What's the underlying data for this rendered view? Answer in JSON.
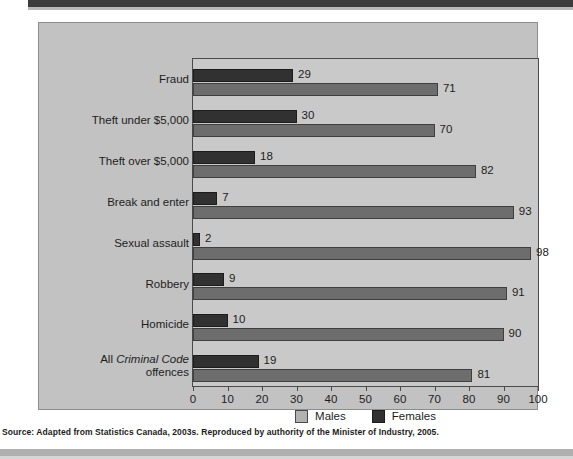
{
  "figure": {
    "source_note": "Source: Adapted from Statistics Canada, 2003s. Reproduced by authority of the Minister of Industry, 2005."
  },
  "legend": {
    "items": [
      {
        "label": "Males",
        "color": "#b2b2b2"
      },
      {
        "label": "Females",
        "color": "#313131"
      }
    ]
  },
  "chart_data": {
    "type": "bar",
    "orientation": "horizontal",
    "title": "",
    "subtitle": "",
    "xlabel": "",
    "ylabel": "",
    "xlim": [
      0,
      100
    ],
    "xticks": [
      "0",
      "10",
      "20",
      "30",
      "40",
      "50",
      "60",
      "70",
      "80",
      "90",
      "100"
    ],
    "grid": false,
    "legend_position": "bottom-center",
    "categories": [
      "Fraud",
      "Theft under $5,000",
      "Theft over $5,000",
      "Break and enter",
      "Sexual assault",
      "Robbery",
      "Homicide",
      "All Criminal Code offences"
    ],
    "category_labels_html": [
      "Fraud",
      "Theft under $5,000",
      "Theft over $5,000",
      "Break and enter",
      "Sexual assault",
      "Robbery",
      "Homicide",
      "All <i>Criminal Code</i>\noffences"
    ],
    "series": [
      {
        "name": "Females",
        "color": "#313131",
        "values": [
          29,
          30,
          18,
          7,
          2,
          9,
          10,
          19
        ]
      },
      {
        "name": "Males",
        "color": "#6d6d6d",
        "values": [
          71,
          70,
          82,
          93,
          98,
          91,
          90,
          81
        ]
      }
    ],
    "data_labels": {
      "Females": [
        "29",
        "30",
        "18",
        "7",
        "2",
        "9",
        "10",
        "19"
      ],
      "Males": [
        "71",
        "70",
        "82",
        "93",
        "98",
        "91",
        "90",
        "81"
      ]
    }
  }
}
